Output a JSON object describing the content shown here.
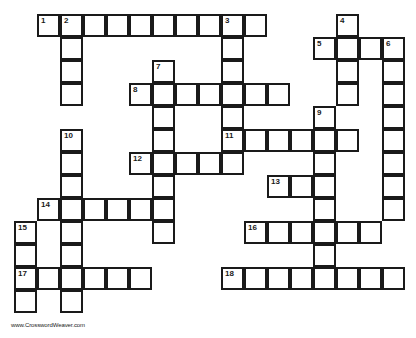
{
  "puzzle": {
    "cell_size": 23,
    "origin": {
      "x": 14,
      "y": 14
    },
    "line_color": "#1a1a1a",
    "entries": [
      {
        "number": "1",
        "direction": "across",
        "row": 0,
        "col": 1,
        "length": 10
      },
      {
        "number": "2",
        "direction": "down",
        "row": 0,
        "col": 2,
        "length": 4
      },
      {
        "number": "3",
        "direction": "down",
        "row": 0,
        "col": 9,
        "length": 7
      },
      {
        "number": "4",
        "direction": "down",
        "row": 0,
        "col": 14,
        "length": 4
      },
      {
        "number": "5",
        "direction": "across",
        "row": 1,
        "col": 13,
        "length": 4
      },
      {
        "number": "6",
        "direction": "down",
        "row": 1,
        "col": 16,
        "length": 8
      },
      {
        "number": "7",
        "direction": "down",
        "row": 2,
        "col": 6,
        "length": 8
      },
      {
        "number": "8",
        "direction": "across",
        "row": 3,
        "col": 5,
        "length": 7
      },
      {
        "number": "9",
        "direction": "down",
        "row": 4,
        "col": 13,
        "length": 8
      },
      {
        "number": "10",
        "direction": "down",
        "row": 5,
        "col": 2,
        "length": 8
      },
      {
        "number": "11",
        "direction": "across",
        "row": 5,
        "col": 9,
        "length": 6
      },
      {
        "number": "12",
        "direction": "across",
        "row": 6,
        "col": 5,
        "length": 5
      },
      {
        "number": "13",
        "direction": "across",
        "row": 7,
        "col": 11,
        "length": 3
      },
      {
        "number": "14",
        "direction": "across",
        "row": 8,
        "col": 1,
        "length": 6
      },
      {
        "number": "15",
        "direction": "down",
        "row": 9,
        "col": 0,
        "length": 4
      },
      {
        "number": "16",
        "direction": "across",
        "row": 9,
        "col": 10,
        "length": 6
      },
      {
        "number": "17",
        "direction": "across",
        "row": 11,
        "col": 0,
        "length": 6
      },
      {
        "number": "18",
        "direction": "across",
        "row": 11,
        "col": 9,
        "length": 8
      }
    ]
  },
  "footer": {
    "credit": "www.CrosswordWeaver.com"
  }
}
